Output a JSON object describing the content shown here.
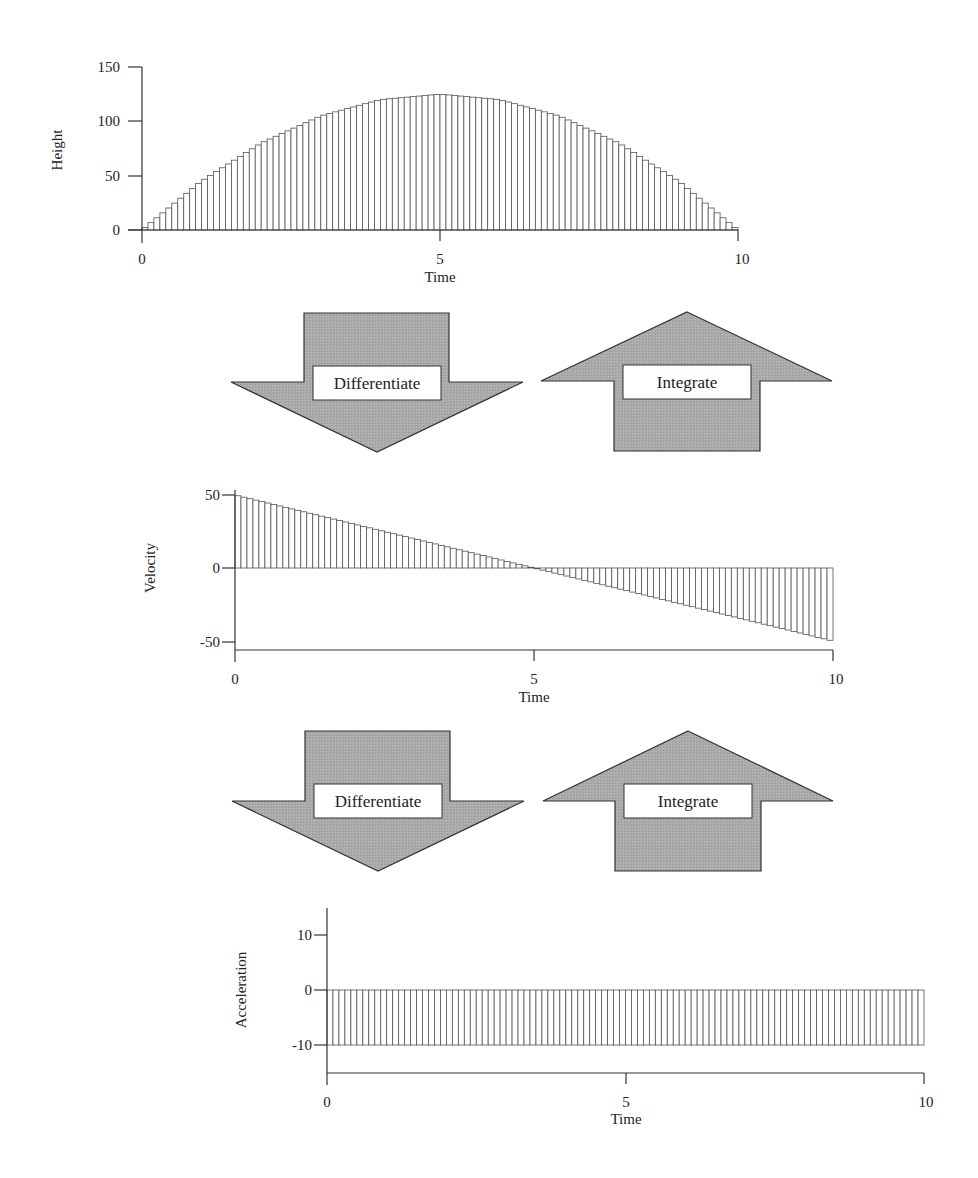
{
  "colors": {
    "ink": "#333333",
    "bar_stroke": "#555555",
    "arrow_fill": "#a9a9a9",
    "label_box": "#ffffff"
  },
  "arrows": [
    {
      "row": 1,
      "differentiate_label": "Differentiate",
      "integrate_label": "Integrate"
    },
    {
      "row": 2,
      "differentiate_label": "Differentiate",
      "integrate_label": "Integrate"
    }
  ],
  "chart_data": [
    {
      "type": "bar",
      "title": "",
      "xlabel": "Time",
      "ylabel": "Height",
      "xlim": [
        0,
        10
      ],
      "ylim": [
        0,
        150
      ],
      "xticks": [
        0,
        5,
        10
      ],
      "yticks": [
        0,
        50,
        100,
        150
      ],
      "grid": false,
      "legend": null,
      "formula": "h(t) = 50t - 5t^2",
      "bar_count": 100,
      "x": [
        0,
        1,
        2,
        3,
        4,
        5,
        6,
        7,
        8,
        9,
        10
      ],
      "values": [
        0,
        45,
        80,
        105,
        120,
        125,
        120,
        105,
        80,
        45,
        0
      ]
    },
    {
      "type": "bar",
      "title": "",
      "xlabel": "Time",
      "ylabel": "Velocity",
      "xlim": [
        0,
        10
      ],
      "ylim": [
        -50,
        50
      ],
      "xticks": [
        0,
        5,
        10
      ],
      "yticks": [
        -50,
        0,
        50
      ],
      "grid": false,
      "legend": null,
      "formula": "v(t) = 50 - 10t",
      "bar_count": 100,
      "x": [
        0,
        1,
        2,
        3,
        4,
        5,
        6,
        7,
        8,
        9,
        10
      ],
      "values": [
        50,
        40,
        30,
        20,
        10,
        0,
        -10,
        -20,
        -30,
        -40,
        -50
      ]
    },
    {
      "type": "bar",
      "title": "",
      "xlabel": "Time",
      "ylabel": "Acceleration",
      "xlim": [
        0,
        10
      ],
      "ylim": [
        -15,
        15
      ],
      "xticks": [
        0,
        5,
        10
      ],
      "yticks": [
        -10,
        0,
        10
      ],
      "grid": false,
      "legend": null,
      "formula": "a(t) = -10",
      "bar_count": 100,
      "x": [
        0,
        1,
        2,
        3,
        4,
        5,
        6,
        7,
        8,
        9,
        10
      ],
      "values": [
        -10,
        -10,
        -10,
        -10,
        -10,
        -10,
        -10,
        -10,
        -10,
        -10,
        -10
      ]
    }
  ]
}
